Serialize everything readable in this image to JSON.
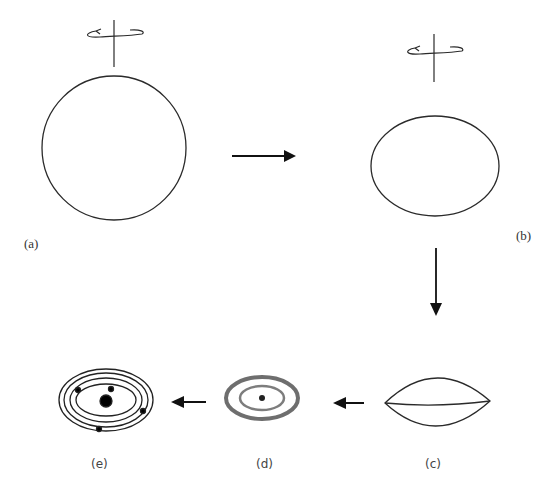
{
  "figure": {
    "colors": {
      "stroke": "#2a2a2a",
      "background": "#ffffff",
      "disk": "#555555"
    },
    "panels": [
      {
        "id": "a",
        "label": "(a)",
        "shape": "sphere",
        "description": "Rotating spherical cloud"
      },
      {
        "id": "b",
        "label": "(b)",
        "shape": "oblate-ellipsoid",
        "description": "Cloud flattens as it spins"
      },
      {
        "id": "c",
        "label": "(c)",
        "shape": "lens-disk",
        "description": "Flattened lens-shaped disk"
      },
      {
        "id": "d",
        "label": "(d)",
        "shape": "protoplanetary-disk",
        "description": "Disk with rings and central core"
      },
      {
        "id": "e",
        "label": "(e)",
        "shape": "planetary-system",
        "description": "Central star with orbiting planets"
      }
    ],
    "arrows": [
      {
        "from": "a",
        "to": "b",
        "direction": "right"
      },
      {
        "from": "b",
        "to": "c",
        "direction": "down"
      },
      {
        "from": "c",
        "to": "d",
        "direction": "left"
      },
      {
        "from": "d",
        "to": "e",
        "direction": "left"
      }
    ],
    "rotation_icons": [
      "rotation-axis-a",
      "rotation-axis-b"
    ]
  }
}
